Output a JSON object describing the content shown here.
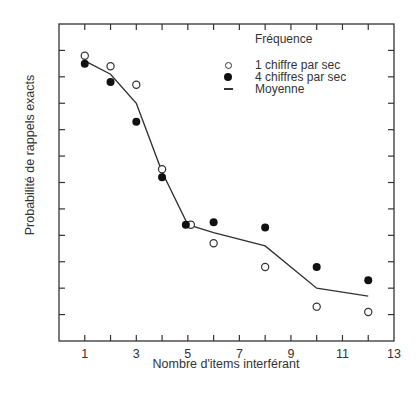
{
  "chart_data": {
    "type": "line",
    "title": "",
    "xlabel": "Nombre d'items interférant",
    "ylabel": "Probabilité de rappels exacts",
    "xlim": [
      0,
      13
    ],
    "ylim": [
      0,
      1.2
    ],
    "x_ticks": [
      1,
      2,
      3,
      4,
      5,
      6,
      7,
      8,
      9,
      10,
      11,
      12,
      13
    ],
    "x_tick_labels": [
      "1",
      "3",
      "5",
      "7",
      "9",
      "11",
      "13"
    ],
    "y_ticks_count": 11,
    "y_tick_labels": [],
    "grid": false,
    "legend_title": "Fréquence",
    "legend_position": "upper right",
    "x": [
      1,
      2,
      3,
      4,
      5,
      6,
      8,
      10,
      12
    ],
    "series": [
      {
        "name": "1 chiffre par sec",
        "marker": "open-circle",
        "values": [
          1.08,
          1.04,
          0.97,
          0.65,
          0.44,
          0.37,
          0.28,
          0.13,
          0.11
        ]
      },
      {
        "name": "4 chiffres par sec",
        "marker": "filled-circle",
        "values": [
          1.05,
          0.98,
          0.83,
          0.62,
          0.44,
          0.45,
          0.43,
          0.28,
          0.23
        ]
      },
      {
        "name": "Moyenne",
        "marker": "line",
        "values": [
          1.06,
          1.01,
          0.9,
          0.64,
          0.44,
          0.41,
          0.36,
          0.2,
          0.17
        ]
      }
    ]
  },
  "legend": {
    "title": "Fréquence",
    "items": [
      {
        "label": "1 chiffre par sec"
      },
      {
        "label": "4 chiffres par sec"
      },
      {
        "label": "Moyenne"
      }
    ]
  },
  "axes": {
    "xlabel": "Nombre d'items interférant",
    "ylabel": "Probabilité de rappels exacts"
  },
  "colors": {
    "axis": "#333333",
    "text": "#333333",
    "filled_marker": "#111111",
    "line": "#333333"
  }
}
